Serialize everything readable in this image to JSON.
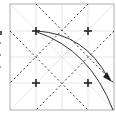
{
  "diagram": {
    "type": "origami-crease-pattern",
    "frame": {
      "x": 10,
      "y": 4,
      "w": 104,
      "h": 106,
      "stroke": "#b0b0b0"
    },
    "grid_color": "#d8d8d8",
    "dash_color": "#333333",
    "mark_color": "#222222",
    "plus_marks": [
      {
        "x": 36,
        "y": 31
      },
      {
        "x": 88,
        "y": 31
      },
      {
        "x": 36,
        "y": 83
      },
      {
        "x": 88,
        "y": 83
      }
    ],
    "arrows": [
      {
        "name": "fold-arrow-outer",
        "from": [
          36,
          31
        ],
        "to": [
          110,
          82
        ]
      },
      {
        "name": "fold-arrow-inner",
        "from": [
          36,
          31
        ],
        "to": [
          113,
          110
        ]
      }
    ]
  }
}
